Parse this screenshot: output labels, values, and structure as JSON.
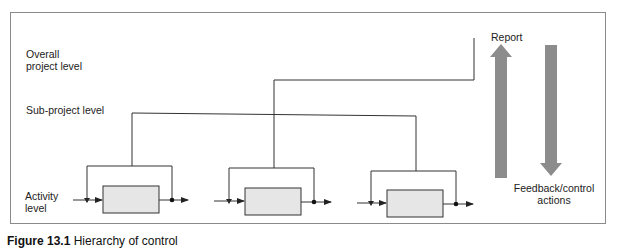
{
  "levels": {
    "overall": "Overall project level",
    "overall_line1": "Overall",
    "overall_line2": "project level",
    "sub_project": "Sub-project level",
    "activity_line1": "Activity",
    "activity_line2": "level"
  },
  "flows": {
    "report_label": "Report",
    "feedback_line1": "Feedback/control",
    "feedback_line2": "actions"
  },
  "activities": [
    {
      "name": "activity-1"
    },
    {
      "name": "activity-2"
    },
    {
      "name": "activity-3"
    }
  ],
  "colors": {
    "box_fill": "#e6e6e6",
    "arrow_fill": "#8c8c8c",
    "line": "#333333",
    "frame": "#8a8a8a"
  },
  "caption": {
    "label": "Figure 13.1",
    "text": "Hierarchy of control"
  }
}
